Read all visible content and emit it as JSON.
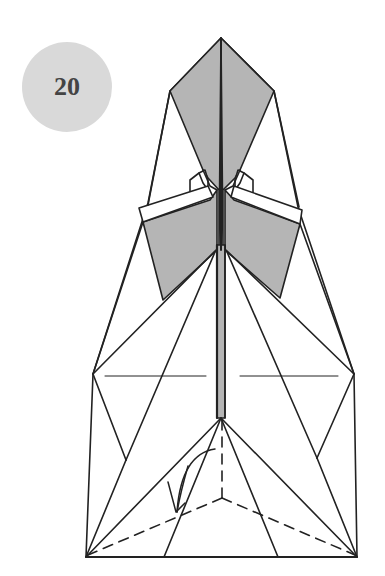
{
  "step": {
    "number": "20",
    "badge_color": "#d9d9d9",
    "text_color": "#444444"
  },
  "diagram": {
    "fill_color": "#b5b5b5",
    "line_color": "#222222",
    "symbols": [
      "valley-fold-dashed-lines",
      "fold-arrow"
    ]
  }
}
